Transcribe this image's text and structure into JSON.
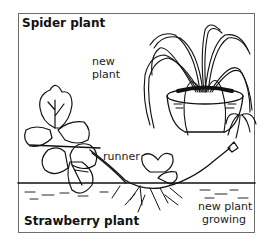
{
  "diagram": {
    "titles": {
      "top": "Spider plant",
      "bottom": "Strawberry plant"
    },
    "labels": {
      "new_plant_line1": "new",
      "new_plant_line2": "plant",
      "runner": "runner",
      "new_plant_growing_line1": "new plant",
      "new_plant_growing_line2": "growing"
    },
    "colors": {
      "ink": "#111111",
      "frame": "#6d6d6d",
      "background": "#ffffff"
    }
  }
}
